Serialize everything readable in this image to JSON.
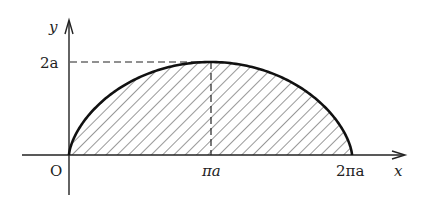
{
  "figure": {
    "type": "cycloid-area",
    "axes": {
      "x_label": "x",
      "y_label": "y",
      "origin_label": "O"
    },
    "ticks": {
      "y_max_label": "2a",
      "x_mid_label": "πa",
      "x_end_label": "2πa"
    },
    "curve": {
      "description": "One arch of a cycloid x = a(t − sin t), y = a(1 − cos t), 0 ≤ t ≤ 2π",
      "start": [
        0,
        0
      ],
      "peak": [
        "πa",
        "2a"
      ],
      "end": [
        "2πa",
        0
      ]
    },
    "region": "Area under one arch, shaded with diagonal hatching",
    "guides": "Dashed lines from (πa, 2a) to the y-axis and down to the x-axis",
    "colors": {
      "ink": "#222222",
      "background": "#ffffff"
    }
  }
}
